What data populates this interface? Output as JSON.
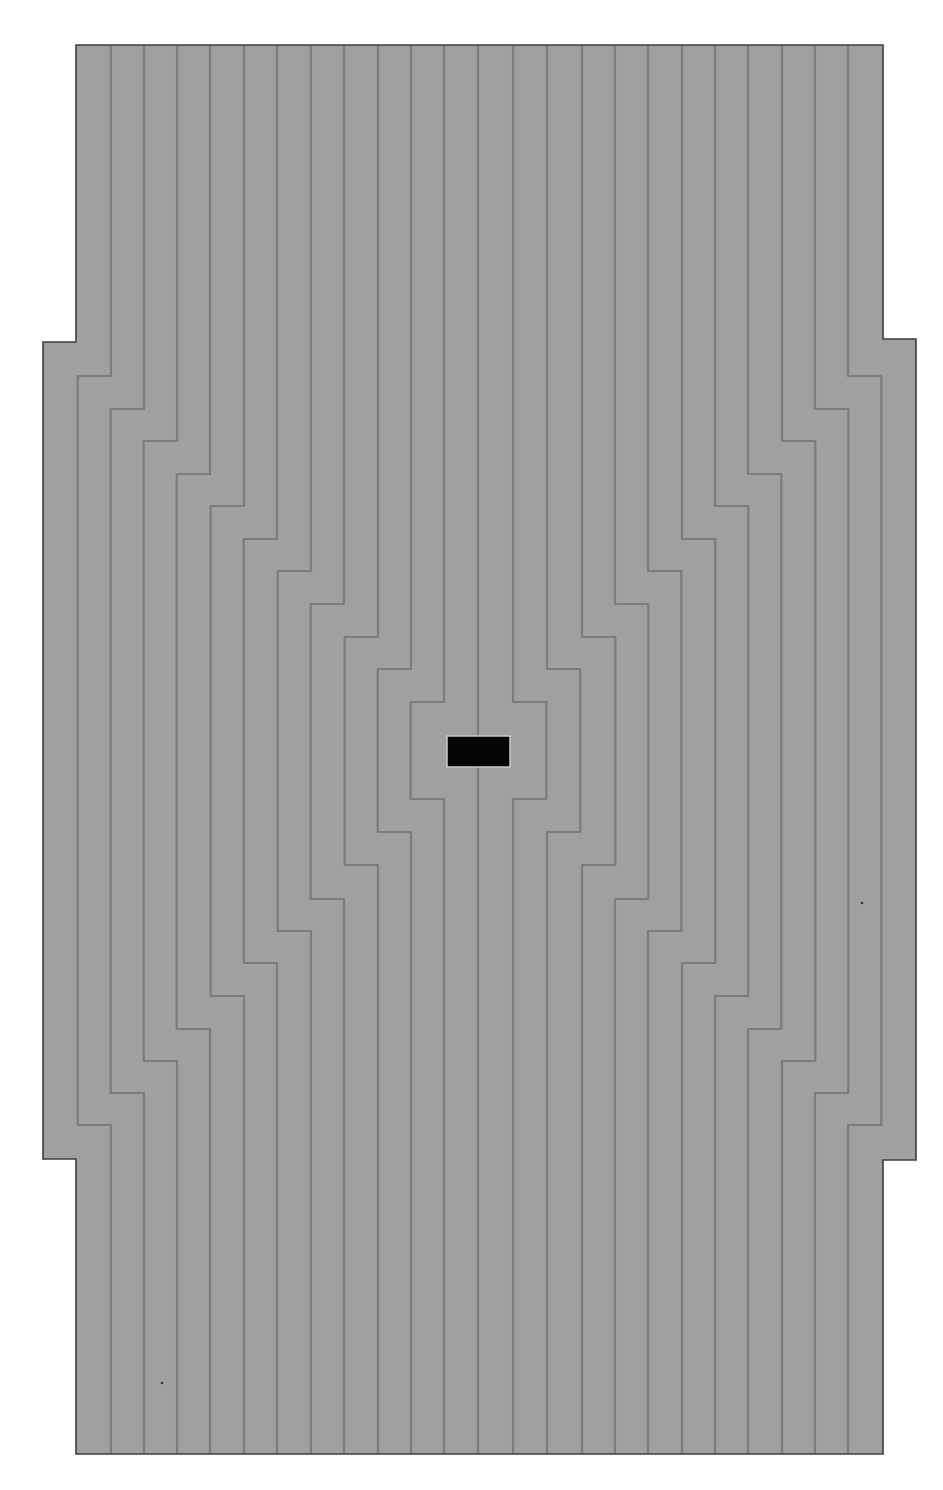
{
  "canvas": {
    "width": 943,
    "height": 1490
  },
  "colors": {
    "background": "#ffffff",
    "fill": "#a0a0a0",
    "line": "#7c7c7c",
    "outline": "#3e3e3e",
    "center_block": "#050505",
    "center_block_border": "#c8c8c8"
  },
  "outline": {
    "main": {
      "left": 76,
      "top": 45,
      "right": 883,
      "bottom": 1454
    },
    "left_tab": {
      "left": 43,
      "top": 342,
      "bottom": 1159
    },
    "right_tab": {
      "right": 916,
      "top": 339,
      "bottom": 1160
    }
  },
  "center_line": {
    "x": 478,
    "top": 46,
    "bottom": 1453
  },
  "center_block": {
    "x": 447,
    "y": 736,
    "width": 63,
    "height": 31
  },
  "step_offset": 33.3,
  "left_lines": [
    {
      "x": 111,
      "step_out_y": 376,
      "step_back_y": 1125
    },
    {
      "x": 144,
      "step_out_y": 409,
      "step_back_y": 1093
    },
    {
      "x": 177,
      "step_out_y": 441,
      "step_back_y": 1061
    },
    {
      "x": 210,
      "step_out_y": 474,
      "step_back_y": 1029
    },
    {
      "x": 244,
      "step_out_y": 506,
      "step_back_y": 996
    },
    {
      "x": 277,
      "step_out_y": 539,
      "step_back_y": 963
    },
    {
      "x": 311,
      "step_out_y": 571,
      "step_back_y": 931
    },
    {
      "x": 344,
      "step_out_y": 604,
      "step_back_y": 899
    },
    {
      "x": 378,
      "step_out_y": 637,
      "step_back_y": 865
    },
    {
      "x": 411,
      "step_out_y": 669,
      "step_back_y": 832
    },
    {
      "x": 444,
      "step_out_y": 702,
      "step_back_y": 799
    }
  ],
  "right_lines": [
    {
      "x": 848,
      "step_out_y": 376,
      "step_back_y": 1125
    },
    {
      "x": 815,
      "step_out_y": 409,
      "step_back_y": 1093
    },
    {
      "x": 782,
      "step_out_y": 441,
      "step_back_y": 1061
    },
    {
      "x": 748,
      "step_out_y": 474,
      "step_back_y": 1029
    },
    {
      "x": 715,
      "step_out_y": 506,
      "step_back_y": 996
    },
    {
      "x": 682,
      "step_out_y": 539,
      "step_back_y": 963
    },
    {
      "x": 648,
      "step_out_y": 571,
      "step_back_y": 931
    },
    {
      "x": 615,
      "step_out_y": 604,
      "step_back_y": 899
    },
    {
      "x": 582,
      "step_out_y": 637,
      "step_back_y": 865
    },
    {
      "x": 547,
      "step_out_y": 669,
      "step_back_y": 832
    },
    {
      "x": 513,
      "step_out_y": 702,
      "step_back_y": 799
    }
  ],
  "specks": [
    {
      "x": 862,
      "y": 903
    },
    {
      "x": 162,
      "y": 1383
    }
  ]
}
